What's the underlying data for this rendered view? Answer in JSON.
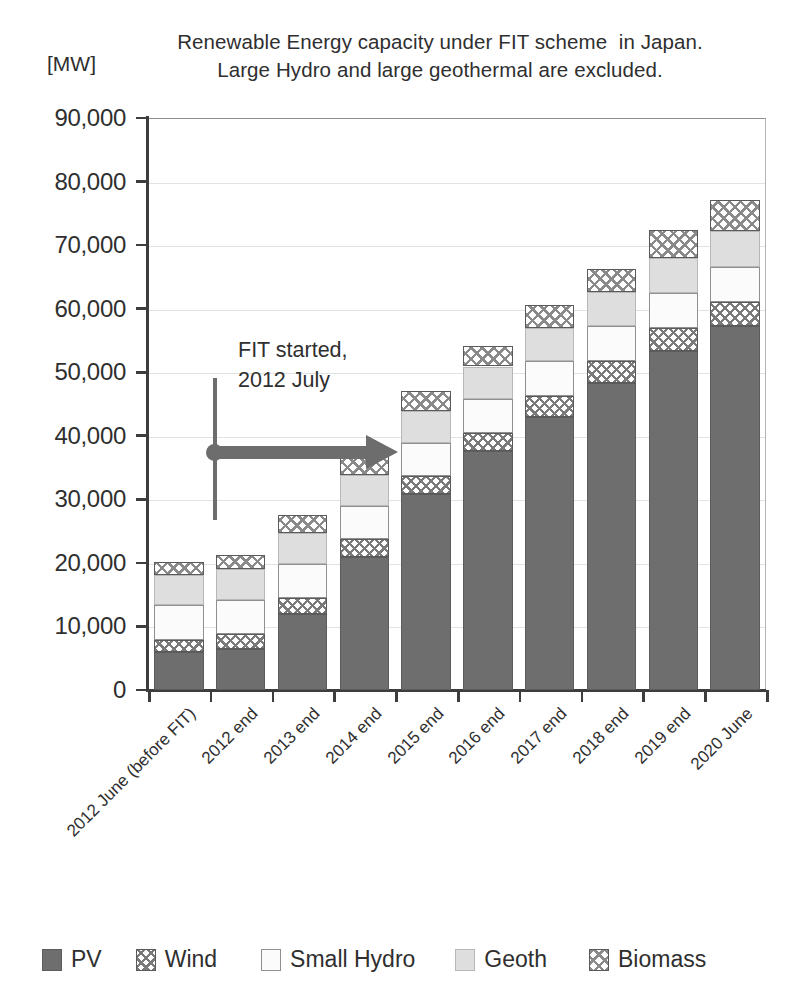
{
  "axis_unit": "[MW]",
  "title": {
    "line1": "Renewable Energy capacity under FIT scheme  in Japan.",
    "line2": "Large Hydro and large geothermal are excluded."
  },
  "annotation": {
    "line1": "FIT started,",
    "line2": "2012 July"
  },
  "legend": [
    {
      "label": "PV",
      "key": "pv",
      "color": "#6e6e6e"
    },
    {
      "label": "Wind",
      "key": "wind",
      "color": "#ffffff"
    },
    {
      "label": "Small Hydro",
      "key": "hydro",
      "color": "#fbfbfb"
    },
    {
      "label": "Geoth",
      "key": "geoth",
      "color": "#dedede"
    },
    {
      "label": "Biomass",
      "key": "biomass",
      "color": "#ffffff"
    }
  ],
  "chart_data": {
    "type": "bar",
    "stacked": true,
    "title": "Renewable Energy capacity under FIT scheme  in Japan. Large Hydro and large geothermal are excluded.",
    "xlabel": "",
    "ylabel": "[MW]",
    "ylim": [
      0,
      90000
    ],
    "ytick_step": 10000,
    "ytick_labels": [
      "0",
      "10,000",
      "20,000",
      "30,000",
      "40,000",
      "50,000",
      "60,000",
      "70,000",
      "80,000",
      "90,000"
    ],
    "grid": true,
    "legend_position": "bottom",
    "categories": [
      "2012 June (before FIT)",
      "2012 end",
      "2013 end",
      "2014 end",
      "2015 end",
      "2016 end",
      "2017 end",
      "2018 end",
      "2019 end",
      "2020 June"
    ],
    "series": [
      {
        "name": "PV",
        "values": [
          6000,
          6400,
          12000,
          21000,
          30800,
          37600,
          43000,
          48300,
          53300,
          57200
        ]
      },
      {
        "name": "Wind",
        "values": [
          1900,
          2400,
          2500,
          2700,
          2800,
          2900,
          3300,
          3500,
          3700,
          3900
        ]
      },
      {
        "name": "Small Hydro",
        "values": [
          5500,
          5400,
          5300,
          5200,
          5300,
          5300,
          5400,
          5400,
          5500,
          5500
        ]
      },
      {
        "name": "Geoth",
        "values": [
          4700,
          4800,
          4900,
          4900,
          5000,
          5100,
          5300,
          5400,
          5500,
          5600
        ]
      },
      {
        "name": "Biomass",
        "values": [
          2100,
          2200,
          2900,
          3000,
          3200,
          3200,
          3500,
          3700,
          4300,
          4900
        ]
      }
    ],
    "totals": [
      20200,
      21200,
      27600,
      36800,
      47100,
      54100,
      60500,
      66300,
      72300,
      77100
    ],
    "annotations": [
      {
        "text": "FIT started, 2012 July",
        "x_category": "2012 end",
        "y_value": 39000,
        "type": "arrow-right"
      }
    ]
  }
}
